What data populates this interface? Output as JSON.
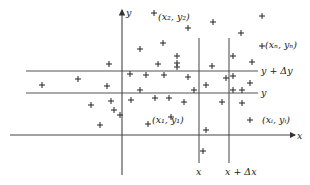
{
  "diagram": {
    "type": "scatter-grid-illustration",
    "axes": {
      "x_label": "x",
      "y_label": "y"
    },
    "band_labels": {
      "upper_horizontal": "y + Δy",
      "lower_horizontal": "y",
      "left_vertical": "x",
      "right_vertical": "x + Δx"
    },
    "point_labels": [
      {
        "text": "(x₂, y₂)",
        "x": 158,
        "y": 20
      },
      {
        "text": "(xₙ, yₙ)",
        "x": 265,
        "y": 48
      },
      {
        "text": "(x₁, y₁)",
        "x": 152,
        "y": 123
      },
      {
        "text": "(xᵢ, yᵢ)",
        "x": 262,
        "y": 123
      }
    ],
    "points": [
      [
        154,
        13
      ],
      [
        262,
        16
      ],
      [
        213,
        22
      ],
      [
        188,
        28
      ],
      [
        241,
        33
      ],
      [
        163,
        43
      ],
      [
        262,
        46
      ],
      [
        140,
        49
      ],
      [
        177,
        56
      ],
      [
        233,
        56
      ],
      [
        109,
        64
      ],
      [
        158,
        64
      ],
      [
        177,
        63
      ],
      [
        177,
        67
      ],
      [
        212,
        66
      ],
      [
        252,
        62
      ],
      [
        130,
        74
      ],
      [
        78,
        79
      ],
      [
        146,
        75
      ],
      [
        164,
        75
      ],
      [
        188,
        77
      ],
      [
        226,
        78
      ],
      [
        233,
        76
      ],
      [
        42,
        85
      ],
      [
        107,
        86
      ],
      [
        206,
        85
      ],
      [
        250,
        83
      ],
      [
        111,
        101
      ],
      [
        184,
        102
      ],
      [
        91,
        105
      ],
      [
        114,
        110
      ],
      [
        169,
        98
      ],
      [
        131,
        100
      ],
      [
        100,
        125
      ],
      [
        148,
        124
      ],
      [
        222,
        102
      ],
      [
        242,
        103
      ],
      [
        171,
        117
      ],
      [
        250,
        120
      ],
      [
        120,
        115
      ],
      [
        206,
        130
      ],
      [
        203,
        151
      ],
      [
        233,
        90
      ],
      [
        242,
        90
      ],
      [
        194,
        90
      ],
      [
        140,
        90
      ],
      [
        155,
        98
      ]
    ]
  }
}
